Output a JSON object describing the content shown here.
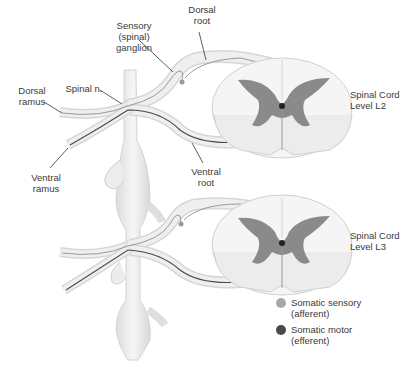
{
  "labels": {
    "sensory_ganglion": [
      "Sensory",
      "(spinal)",
      "ganglion"
    ],
    "dorsal_root": [
      "Dorsal",
      "root"
    ],
    "dorsal_ramus": [
      "Dorsal",
      "ramus"
    ],
    "spinal_nerve": "Spinal n.",
    "ventral_ramus": [
      "Ventral",
      "ramus"
    ],
    "ventral_root": [
      "Ventral",
      "root"
    ],
    "cord_l2": [
      "Spinal Cord",
      "Level L2"
    ],
    "cord_l3": [
      "Spinal Cord",
      "Level L3"
    ]
  },
  "legend": [
    {
      "label": "Somatic sensory",
      "sub": "(afferent)",
      "color": "#a8a8a8"
    },
    {
      "label": "Somatic motor",
      "sub": "(efferent)",
      "color": "#4a4a4a"
    }
  ],
  "colors": {
    "nerve_fill": "#ececec",
    "nerve_edge": "#cfcfcf",
    "grey_matter": "#8a8a8a",
    "white_matter": "#f4f4f4",
    "fiber_sensory": "#9a9a9a",
    "fiber_motor": "#4a4a4a"
  }
}
